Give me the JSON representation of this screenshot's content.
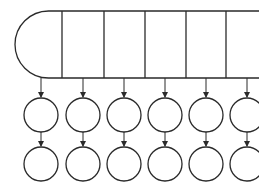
{
  "diagram": {
    "type": "array-of-linked-lists",
    "stroke_color": "#2a2a2a",
    "background": "#ffffff",
    "header_bar": {
      "top_y": 11,
      "bottom_y": 78,
      "left_x": 15,
      "right_x": 259,
      "left_cap": "semicircle",
      "cell_dividers_x": [
        62,
        104,
        145,
        186,
        226
      ]
    },
    "columns": [
      {
        "index": 0,
        "center_x": 41
      },
      {
        "index": 1,
        "center_x": 83
      },
      {
        "index": 2,
        "center_x": 124
      },
      {
        "index": 3,
        "center_x": 165
      },
      {
        "index": 4,
        "center_x": 206
      },
      {
        "index": 5,
        "center_x": 247
      }
    ],
    "node_rows": [
      {
        "row": 1,
        "center_y": 115
      },
      {
        "row": 2,
        "center_y": 164
      }
    ],
    "node_radius": 17,
    "labels": []
  }
}
